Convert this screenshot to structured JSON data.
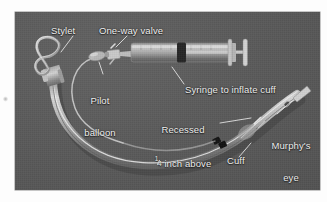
{
  "figure": {
    "name": "endotracheal-tube-components",
    "background_color": "#fdfdfd",
    "photo_background_color": "#5a5a5a",
    "label_color": "#f2f2f2"
  },
  "labels": {
    "stylet": "Stylet",
    "one_way_valve": "One-way valve",
    "pilot_balloon_line1": "Pilot",
    "pilot_balloon_line2": "balloon",
    "syringe": "Syringe to inflate cuff",
    "recessed_line1": "Recessed",
    "recessed_line2_prefix": "",
    "recessed_fraction_numerator": "1",
    "recessed_fraction_denominator": "4",
    "recessed_line2_suffix": " inch above",
    "recessed_line3": "Murphy's eye",
    "murphys_eye_line1": "Murphy's",
    "murphys_eye_line2": "eye",
    "cuff": "Cuff"
  },
  "parts": [
    {
      "id": "stylet",
      "label": "Stylet"
    },
    {
      "id": "one-way-valve",
      "label": "One-way valve"
    },
    {
      "id": "pilot-balloon",
      "label": "Pilot balloon"
    },
    {
      "id": "syringe",
      "label": "Syringe to inflate cuff"
    },
    {
      "id": "recessed-marker",
      "label": "Recessed 1/4 inch above Murphy's eye"
    },
    {
      "id": "cuff",
      "label": "Cuff"
    },
    {
      "id": "murphys-eye",
      "label": "Murphy's eye"
    }
  ]
}
